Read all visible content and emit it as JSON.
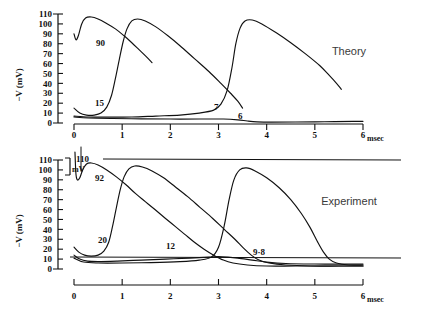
{
  "figure": {
    "axis_unit_label": "msec",
    "y_axis_label": "−V (mV)",
    "y_ticks": [
      "0",
      "10",
      "20",
      "30",
      "40",
      "50",
      "60",
      "70",
      "80",
      "90",
      "100",
      "110"
    ],
    "x_ticks": [
      "0",
      "1",
      "2",
      "3",
      "4",
      "5",
      "6"
    ]
  },
  "theory": {
    "title": "Theory",
    "curve_labels": [
      "90",
      "15",
      "7",
      "6"
    ]
  },
  "experiment": {
    "title": "Experiment",
    "reference_value": "110",
    "reference_unit": "mV",
    "curve_labels": [
      "92",
      "20",
      "12",
      "9·8"
    ]
  },
  "chart_data": [
    {
      "type": "line",
      "title": "Theory",
      "xlabel": "msec",
      "ylabel": "−V (mV)",
      "xlim": [
        0,
        6
      ],
      "ylim": [
        0,
        110
      ],
      "grid": false,
      "legend": "inline curve labels",
      "series": [
        {
          "name": "90",
          "annotation": "90",
          "points": [
            [
              0,
              90
            ],
            [
              0.04,
              84
            ],
            [
              0.09,
              88
            ],
            [
              0.16,
              100
            ],
            [
              0.24,
              106
            ],
            [
              0.36,
              107
            ],
            [
              0.5,
              105
            ],
            [
              0.66,
              101
            ],
            [
              0.86,
              95
            ],
            [
              1.04,
              88
            ],
            [
              1.2,
              81
            ],
            [
              1.35,
              74
            ],
            [
              1.5,
              67
            ],
            [
              1.62,
              61
            ]
          ]
        },
        {
          "name": "15",
          "annotation": "15",
          "points": [
            [
              0,
              15
            ],
            [
              0.12,
              10
            ],
            [
              0.26,
              8
            ],
            [
              0.42,
              8
            ],
            [
              0.56,
              10
            ],
            [
              0.68,
              16
            ],
            [
              0.78,
              28
            ],
            [
              0.86,
              45
            ],
            [
              0.94,
              64
            ],
            [
              1.02,
              82
            ],
            [
              1.1,
              95
            ],
            [
              1.2,
              103
            ],
            [
              1.32,
              105
            ],
            [
              1.48,
              103
            ],
            [
              1.7,
              97
            ],
            [
              1.95,
              88
            ],
            [
              2.2,
              78
            ],
            [
              2.5,
              65
            ],
            [
              2.8,
              52
            ],
            [
              3.05,
              40
            ],
            [
              3.25,
              30
            ],
            [
              3.4,
              22
            ],
            [
              3.5,
              15
            ]
          ]
        },
        {
          "name": "7",
          "annotation": "7",
          "points": [
            [
              0,
              7
            ],
            [
              0.3,
              6
            ],
            [
              0.7,
              6
            ],
            [
              1.2,
              6
            ],
            [
              1.7,
              7
            ],
            [
              2.2,
              8
            ],
            [
              2.6,
              10
            ],
            [
              2.9,
              13
            ],
            [
              3.05,
              19
            ],
            [
              3.18,
              33
            ],
            [
              3.28,
              56
            ],
            [
              3.36,
              80
            ],
            [
              3.45,
              96
            ],
            [
              3.55,
              103
            ],
            [
              3.7,
              104
            ],
            [
              3.9,
              100
            ],
            [
              4.2,
              91
            ],
            [
              4.5,
              81
            ],
            [
              4.8,
              70
            ],
            [
              5.1,
              58
            ],
            [
              5.3,
              48
            ],
            [
              5.45,
              40
            ],
            [
              5.55,
              34
            ]
          ]
        },
        {
          "name": "6",
          "annotation": "6",
          "points": [
            [
              0,
              6
            ],
            [
              0.3,
              5
            ],
            [
              0.8,
              4.5
            ],
            [
              1.4,
              4.2
            ],
            [
              2.0,
              4
            ],
            [
              2.6,
              4
            ],
            [
              3.1,
              4
            ],
            [
              3.4,
              3.2
            ],
            [
              3.6,
              2
            ],
            [
              3.8,
              1.2
            ],
            [
              4.1,
              0.9
            ],
            [
              4.6,
              1
            ],
            [
              5.2,
              1.3
            ],
            [
              5.8,
              1.6
            ],
            [
              6.0,
              1.7
            ]
          ]
        }
      ]
    },
    {
      "type": "line",
      "title": "Experiment",
      "xlabel": "msec",
      "ylabel": "−V (mV)",
      "xlim": [
        0,
        6
      ],
      "ylim": [
        0,
        110
      ],
      "grid": false,
      "reference_line": 110,
      "legend": "inline curve labels",
      "series": [
        {
          "name": "92",
          "annotation": "92",
          "points": [
            [
              0.02,
              118
            ],
            [
              0.04,
              96
            ],
            [
              0.07,
              90
            ],
            [
              0.12,
              92
            ],
            [
              0.18,
              100
            ],
            [
              0.26,
              106
            ],
            [
              0.36,
              107
            ],
            [
              0.5,
              105
            ],
            [
              0.68,
              100
            ],
            [
              0.88,
              93
            ],
            [
              1.08,
              85
            ],
            [
              1.28,
              76
            ],
            [
              1.48,
              68
            ],
            [
              1.68,
              60
            ],
            [
              1.9,
              51
            ],
            [
              2.1,
              43
            ],
            [
              2.3,
              35
            ],
            [
              2.5,
              27
            ],
            [
              2.7,
              20
            ],
            [
              2.9,
              14
            ],
            [
              3.1,
              9
            ],
            [
              3.3,
              6
            ],
            [
              3.6,
              4
            ],
            [
              4.0,
              3
            ],
            [
              4.6,
              3
            ],
            [
              5.4,
              3
            ],
            [
              6.0,
              3
            ]
          ]
        },
        {
          "name": "20",
          "annotation": "20",
          "points": [
            [
              0,
              22
            ],
            [
              0.1,
              17
            ],
            [
              0.22,
              14
            ],
            [
              0.36,
              13
            ],
            [
              0.5,
              14
            ],
            [
              0.62,
              18
            ],
            [
              0.72,
              27
            ],
            [
              0.8,
              43
            ],
            [
              0.88,
              62
            ],
            [
              0.96,
              80
            ],
            [
              1.04,
              93
            ],
            [
              1.14,
              101
            ],
            [
              1.26,
              104
            ],
            [
              1.42,
              103
            ],
            [
              1.62,
              99
            ],
            [
              1.86,
              92
            ],
            [
              2.1,
              83
            ],
            [
              2.36,
              73
            ],
            [
              2.62,
              62
            ],
            [
              2.88,
              51
            ],
            [
              3.12,
              40
            ],
            [
              3.34,
              30
            ],
            [
              3.52,
              21
            ],
            [
              3.68,
              14
            ],
            [
              3.84,
              9
            ],
            [
              4.05,
              6
            ],
            [
              4.4,
              4
            ],
            [
              4.9,
              3
            ],
            [
              5.5,
              3
            ],
            [
              6.0,
              3
            ]
          ]
        },
        {
          "name": "12",
          "annotation": "12",
          "points": [
            [
              0,
              14
            ],
            [
              0.12,
              10
            ],
            [
              0.28,
              8
            ],
            [
              0.5,
              7.5
            ],
            [
              0.9,
              8
            ],
            [
              1.4,
              9
            ],
            [
              1.9,
              10
            ],
            [
              2.4,
              11
            ],
            [
              2.8,
              12
            ],
            [
              3.0,
              12.5
            ],
            [
              3.2,
              12
            ],
            [
              3.4,
              11
            ],
            [
              3.7,
              9
            ],
            [
              4.0,
              7
            ],
            [
              4.4,
              5.5
            ],
            [
              5.0,
              5
            ],
            [
              5.6,
              5
            ],
            [
              6.0,
              5
            ]
          ]
        },
        {
          "name": "9·8",
          "annotation": "9·8",
          "points": [
            [
              0,
              11
            ],
            [
              0.2,
              7
            ],
            [
              0.5,
              6
            ],
            [
              1.0,
              6
            ],
            [
              1.6,
              6.5
            ],
            [
              2.2,
              7.5
            ],
            [
              2.6,
              9
            ],
            [
              2.85,
              12
            ],
            [
              3.0,
              22
            ],
            [
              3.12,
              44
            ],
            [
              3.22,
              70
            ],
            [
              3.32,
              90
            ],
            [
              3.44,
              100
            ],
            [
              3.58,
              102
            ],
            [
              3.76,
              99
            ],
            [
              4.0,
              92
            ],
            [
              4.26,
              82
            ],
            [
              4.5,
              70
            ],
            [
              4.72,
              56
            ],
            [
              4.9,
              42
            ],
            [
              5.05,
              28
            ],
            [
              5.18,
              17
            ],
            [
              5.3,
              10
            ],
            [
              5.45,
              6
            ],
            [
              5.7,
              4
            ],
            [
              6.0,
              4
            ]
          ]
        }
      ]
    }
  ]
}
